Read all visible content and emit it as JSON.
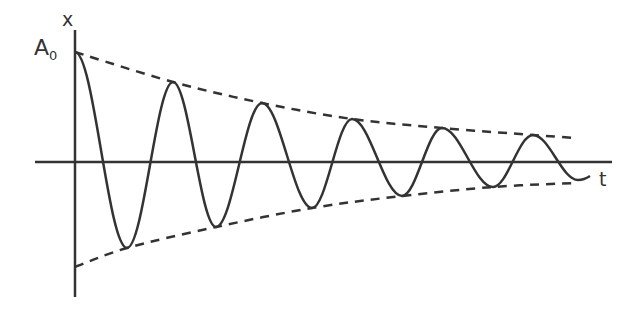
{
  "diagram": {
    "type": "damped-oscillation",
    "colors": {
      "stroke": "#333333",
      "background": "#ffffff"
    },
    "axes": {
      "y_label": "x",
      "x_label": "t",
      "amplitude_label_main": "A",
      "amplitude_label_sub": "0"
    },
    "origin": {
      "x": 75,
      "y": 162
    },
    "x_axis": {
      "x1": 35,
      "x2": 612,
      "y": 162
    },
    "y_axis": {
      "x": 75,
      "y1": 30,
      "y2": 297
    },
    "envelope": {
      "style": "dashed",
      "upper": [
        [
          75,
          52
        ],
        [
          173,
          82
        ],
        [
          262,
          103
        ],
        [
          352,
          119
        ],
        [
          442,
          128
        ],
        [
          533,
          135
        ],
        [
          575,
          138
        ]
      ],
      "lower": [
        [
          75,
          267
        ],
        [
          127,
          248
        ],
        [
          216,
          227
        ],
        [
          312,
          208
        ],
        [
          402,
          196
        ],
        [
          493,
          187
        ],
        [
          575,
          183
        ]
      ]
    },
    "oscillation": {
      "peaks": [
        [
          75,
          52
        ],
        [
          173,
          82
        ],
        [
          262,
          103
        ],
        [
          352,
          119
        ],
        [
          442,
          128
        ],
        [
          533,
          135
        ]
      ],
      "troughs": [
        [
          127,
          248
        ],
        [
          216,
          227
        ],
        [
          312,
          208
        ],
        [
          402,
          196
        ],
        [
          493,
          187
        ],
        [
          578,
          180
        ]
      ],
      "end": [
        590,
        176
      ]
    }
  }
}
